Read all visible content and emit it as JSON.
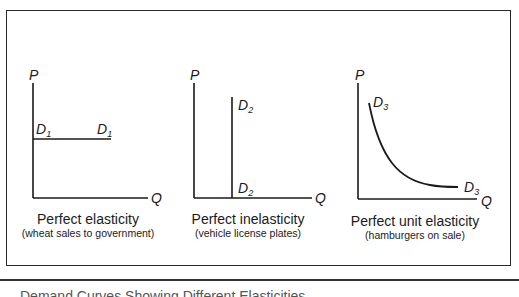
{
  "figure": {
    "panels": [
      {
        "id": "perfect-elasticity",
        "y_axis_label": "P",
        "x_axis_label": "Q",
        "curve_label_base": "D",
        "curve_label_sub": "1",
        "curve_shape": "horizontal",
        "title": "Perfect elasticity",
        "note": "(wheat sales to government)"
      },
      {
        "id": "perfect-inelasticity",
        "y_axis_label": "P",
        "x_axis_label": "Q",
        "curve_label_base": "D",
        "curve_label_sub": "2",
        "curve_shape": "vertical",
        "title": "Perfect inelasticity",
        "note": "(vehicle license plates)"
      },
      {
        "id": "perfect-unit-elasticity",
        "y_axis_label": "P",
        "x_axis_label": "Q",
        "curve_label_base": "D",
        "curve_label_sub": "3",
        "curve_shape": "rectangular-hyperbola",
        "title": "Perfect unit elasticity",
        "note": "(hamburgers on sale)"
      }
    ],
    "bottom_caption_partial": "Demand Curves Showing Different Elasticities"
  },
  "colors": {
    "line": "#1a1a1a",
    "frame": "#2a2a2a",
    "background": "#ffffff"
  }
}
